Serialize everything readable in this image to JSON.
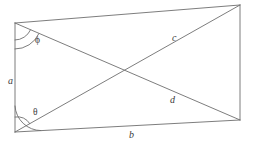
{
  "figure": {
    "stroke_color": "#6e6e6e",
    "label_color": "#3c3c3c",
    "background_color": "#ffffff",
    "labels": {
      "side_left": "a",
      "side_bottom": "b",
      "diagonal_upper": "c",
      "diagonal_lower": "d",
      "angle_top_left": "ϕ",
      "angle_bottom_left": "θ"
    },
    "geometry": {
      "corners": {
        "top_left": [
          15,
          23
        ],
        "top_right": [
          240,
          5
        ],
        "bottom_right": [
          240,
          120
        ],
        "bottom_left": [
          15,
          132
        ]
      },
      "diagonal_crossing": [
        128,
        72
      ],
      "angle_arcs": [
        {
          "name": "phi-arc-outer",
          "vertex": "top_left",
          "radius": 26
        },
        {
          "name": "phi-arc-inner",
          "vertex": "top_left",
          "radius": 17
        },
        {
          "name": "theta-arc-outer",
          "vertex": "bottom_left",
          "radius": 26
        },
        {
          "name": "theta-arc-inner",
          "vertex": "bottom_left",
          "radius": 15
        }
      ]
    }
  }
}
